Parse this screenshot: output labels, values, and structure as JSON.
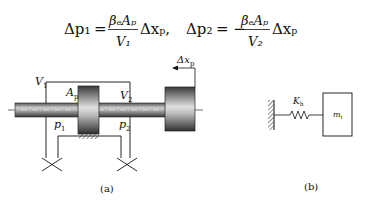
{
  "equations": {
    "eq1": {
      "lhs": "Δp₁",
      "equals": "=",
      "numerator": "βₑAₚ",
      "denominator": "V₁",
      "rhs_tail": "Δxₚ,"
    },
    "eq2": {
      "lhs": "Δp₂",
      "equals": "= −",
      "numerator": "βₑAₚ",
      "denominator": "V₂",
      "rhs_tail": "Δxₚ"
    }
  },
  "figure_a": {
    "caption": "(a)",
    "labels": {
      "V1": "V",
      "V1_sub": "1",
      "V2": "V",
      "V2_sub": "2",
      "Ap": "A",
      "Ap_sub": "p",
      "p1": "p",
      "p1_sub": "1",
      "p2": "p",
      "p2_sub": "2",
      "dx": "Δx",
      "dx_sub": "p"
    }
  },
  "figure_b": {
    "caption": "(b)",
    "labels": {
      "K": "K",
      "K_sub": "h",
      "m": "m",
      "m_sub": "t"
    }
  },
  "colors": {
    "ink": "#111111",
    "metal_dark": "#3a3a3a",
    "metal_light": "#d8d8d8",
    "background": "#ffffff"
  }
}
